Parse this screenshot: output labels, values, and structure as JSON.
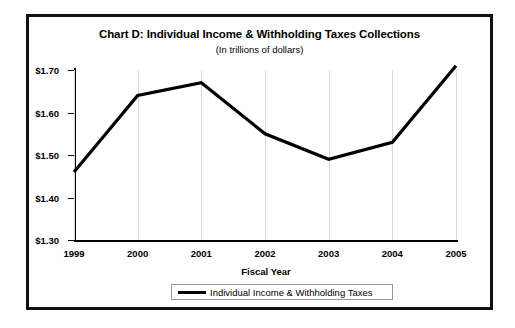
{
  "chart_data": {
    "type": "line",
    "title": "Chart D: Individual Income & Withholding Taxes Collections",
    "subtitle": "(In trillions of dollars)",
    "xlabel": "Fiscal Year",
    "ylabel": "",
    "categories": [
      "1999",
      "2000",
      "2001",
      "2002",
      "2003",
      "2004",
      "2005"
    ],
    "ytick_labels": [
      "$1.70",
      "$1.60",
      "$1.50",
      "$1.40",
      "$1.30"
    ],
    "ytick_values": [
      1.7,
      1.6,
      1.5,
      1.4,
      1.3
    ],
    "ylim": [
      1.3,
      1.7
    ],
    "grid": "vertical",
    "legend_position": "bottom",
    "series": [
      {
        "name": "Individual Income & Withholding Taxes",
        "color": "#000000",
        "values": [
          1.46,
          1.64,
          1.67,
          1.55,
          1.49,
          1.53,
          1.71
        ]
      }
    ]
  },
  "legend": {
    "entries": [
      {
        "label": "Individual Income & Withholding Taxes"
      }
    ]
  }
}
